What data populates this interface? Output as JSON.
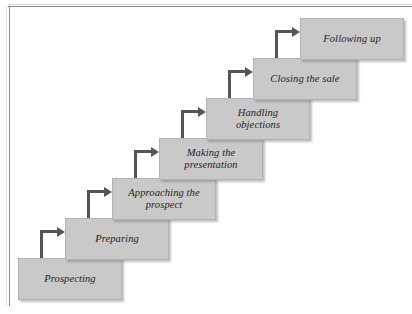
{
  "diagram": {
    "box_fill_color": "#c9c9c9",
    "box_border_color": "#b2b2b2",
    "arrow_color": "#555555",
    "text_color": "#1d1d1d",
    "page_background": "#ffffff",
    "steps": [
      {
        "id": "prospecting",
        "label": "Prospecting",
        "x": 18,
        "y": 258,
        "w": 104,
        "h": 42
      },
      {
        "id": "preparing",
        "label": "Preparing",
        "x": 65,
        "y": 218,
        "w": 104,
        "h": 42
      },
      {
        "id": "approaching",
        "label": "Approaching the\nprospect",
        "x": 112,
        "y": 178,
        "w": 104,
        "h": 42
      },
      {
        "id": "presentation",
        "label": "Making the\npresentation",
        "x": 159,
        "y": 138,
        "w": 104,
        "h": 42
      },
      {
        "id": "objections",
        "label": "Handling\nobjections",
        "x": 206,
        "y": 98,
        "w": 104,
        "h": 42
      },
      {
        "id": "closing",
        "label": "Closing the sale",
        "x": 253,
        "y": 58,
        "w": 104,
        "h": 42
      },
      {
        "id": "following-up",
        "label": "Following up",
        "x": 300,
        "y": 18,
        "w": 104,
        "h": 42
      }
    ],
    "arrows": [
      {
        "id": "arrow-prospecting-to-preparing",
        "x": 40,
        "y": 230,
        "w": 25,
        "h": 30
      },
      {
        "id": "arrow-preparing-to-approaching",
        "x": 87,
        "y": 190,
        "w": 25,
        "h": 30
      },
      {
        "id": "arrow-approaching-to-presentation",
        "x": 134,
        "y": 150,
        "w": 25,
        "h": 30
      },
      {
        "id": "arrow-presentation-to-objections",
        "x": 181,
        "y": 110,
        "w": 25,
        "h": 30
      },
      {
        "id": "arrow-objections-to-closing",
        "x": 228,
        "y": 70,
        "w": 25,
        "h": 30
      },
      {
        "id": "arrow-closing-to-following-up",
        "x": 275,
        "y": 30,
        "w": 25,
        "h": 30
      }
    ]
  }
}
